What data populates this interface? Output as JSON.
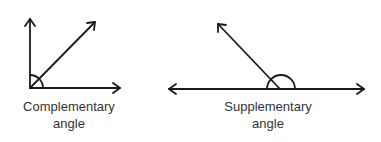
{
  "colors": {
    "stroke": "#1a1a1a",
    "text": "#333333",
    "background": "#ffffff"
  },
  "figures": [
    {
      "id": "complementary",
      "label_line1": "Complementary",
      "label_line2": "angle",
      "vertex": [
        30,
        88
      ],
      "rays": [
        {
          "direction": "up",
          "end": [
            30,
            18
          ]
        },
        {
          "direction": "right",
          "end": [
            120,
            88
          ]
        },
        {
          "direction": "diagonal",
          "end": [
            95,
            22
          ]
        }
      ],
      "angle_marker": "quarter-arc"
    },
    {
      "id": "supplementary",
      "label_line1": "Supplementary",
      "label_line2": "angle",
      "vertex": [
        281,
        89
      ],
      "line": {
        "start": [
          168,
          89
        ],
        "end": [
          364,
          89
        ]
      },
      "ray": {
        "end": [
          218,
          24
        ]
      },
      "angle_marker": "semicircle"
    }
  ]
}
